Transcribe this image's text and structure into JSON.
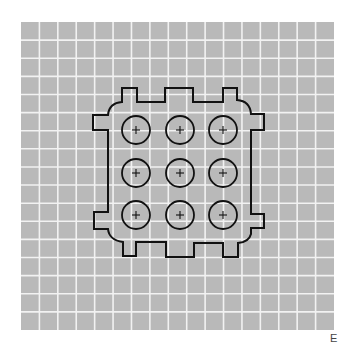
{
  "figure": {
    "panel_label": "E",
    "colors": {
      "background": "#ffffff",
      "grid_fill": "#b9b9b9",
      "grid_line": "#f2f2f2",
      "outline": "#111111",
      "label": "#444444"
    },
    "grid": {
      "x": 21,
      "y": 22,
      "width": 313,
      "height": 308,
      "columns": 17,
      "rows": 17
    },
    "outline_path": "M122,88 L137,88 L137,102 L165,102 L165,88 L193,88 L193,102 L223,102 L223,88 L237,88 L237,100 Q250,101 251,114 L264,114 L264,130 L251,130 L251,214 L264,214 L264,228 L251,228 L251,234 Q249,242 238,243 L238,257 L223,257 L223,243 L194,243 L194,257 L166,257 L166,242 L136,242 L136,256 L123,256 L123,242 Q109,240 108,229 L94,229 L94,212 L108,212 L108,130 L93,130 L93,115 L108,115 Q109,103 122,102 Z",
    "wells": {
      "radius": 14,
      "cross_half": 4,
      "centers": [
        {
          "x": 136,
          "y": 130
        },
        {
          "x": 180,
          "y": 130
        },
        {
          "x": 223,
          "y": 130
        },
        {
          "x": 136,
          "y": 173
        },
        {
          "x": 180,
          "y": 173
        },
        {
          "x": 223,
          "y": 173
        },
        {
          "x": 136,
          "y": 215
        },
        {
          "x": 180,
          "y": 215
        },
        {
          "x": 223,
          "y": 215
        }
      ]
    }
  }
}
